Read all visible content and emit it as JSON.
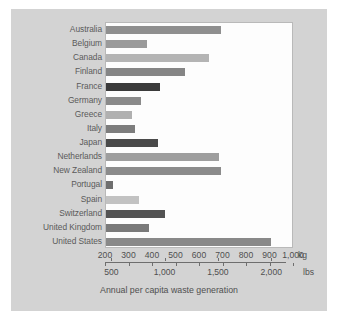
{
  "figure": {
    "caption": "Annual per capita waste generation",
    "background_color": "#d3d3d3",
    "plot_background_color": "#fdfdfd"
  },
  "axis_kg": {
    "unit": "kg",
    "ticks": [
      "200",
      "300",
      "400",
      "500",
      "600",
      "700",
      "800",
      "900",
      "1,000"
    ],
    "min": 200,
    "max": 1000
  },
  "axis_lbs": {
    "unit": "lbs",
    "ticks": [
      "500",
      "1,000",
      "1,500",
      "2,000"
    ],
    "min": 441,
    "max": 2205
  },
  "chart_data": {
    "type": "bar",
    "orientation": "horizontal",
    "title": "",
    "subtitle": "",
    "xlabel": "Annual per capita waste generation",
    "ylabel": "",
    "xlim": [
      200,
      1000
    ],
    "grid": false,
    "legend": "none",
    "unit_primary": "kg",
    "unit_secondary": "lbs",
    "categories": [
      "Australia",
      "Belgium",
      "Canada",
      "Finland",
      "France",
      "Germany",
      "Greece",
      "Italy",
      "Japan",
      "Netherlands",
      "New Zealand",
      "Portugal",
      "Spain",
      "Switzerland",
      "United Kingdom",
      "United States"
    ],
    "values": [
      690,
      375,
      640,
      535,
      430,
      350,
      310,
      325,
      420,
      680,
      690,
      230,
      340,
      450,
      385,
      900
    ],
    "bar_colors": [
      "#8f8f8f",
      "#9a9a9a",
      "#b4b4b4",
      "#858585",
      "#3b3b3b",
      "#8a8a8a",
      "#b0b0b0",
      "#7d7d7d",
      "#4a4a4a",
      "#9e9e9e",
      "#8b8b8b",
      "#6e6e6e",
      "#c2c2c2",
      "#535353",
      "#7a7a7a",
      "#898989"
    ]
  }
}
